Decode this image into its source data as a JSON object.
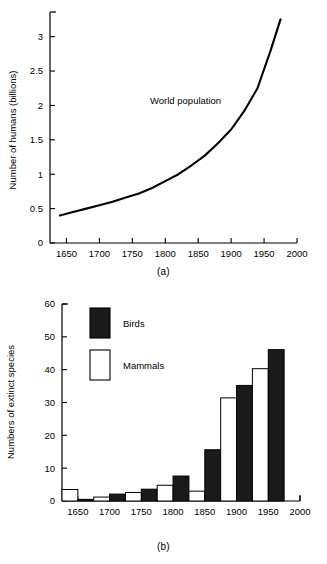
{
  "figure": {
    "panel_a_caption": "(a)",
    "panel_b_caption": "(b)"
  },
  "chart_data": [
    {
      "id": "world-population",
      "type": "line",
      "title": "",
      "annotation": "World population",
      "xlabel": "",
      "ylabel": "Number of humans (billions)",
      "xlim": [
        1625,
        2000
      ],
      "ylim": [
        0,
        3.3
      ],
      "grid": false,
      "legend_position": "none",
      "xticks": [
        1650,
        1700,
        1750,
        1800,
        1850,
        1900,
        1950,
        2000
      ],
      "xtick_labels": [
        "1650",
        "1700",
        "1750",
        "1800",
        "1850",
        "1900",
        "1950",
        "2000"
      ],
      "yticks": [
        0,
        0.5,
        1,
        1.5,
        2,
        2.5,
        3
      ],
      "ytick_labels": [
        "0",
        "0.5",
        "1",
        "1.5",
        "2",
        "2.5",
        "3"
      ],
      "x": [
        1640,
        1660,
        1680,
        1700,
        1720,
        1740,
        1760,
        1780,
        1800,
        1820,
        1840,
        1860,
        1880,
        1900,
        1920,
        1940,
        1960,
        1975
      ],
      "y": [
        0.4,
        0.45,
        0.5,
        0.55,
        0.6,
        0.66,
        0.72,
        0.8,
        0.9,
        1.0,
        1.13,
        1.27,
        1.45,
        1.65,
        1.92,
        2.25,
        2.8,
        3.25
      ],
      "series": [
        {
          "name": "World population",
          "values": [
            0.4,
            0.45,
            0.5,
            0.55,
            0.6,
            0.66,
            0.72,
            0.8,
            0.9,
            1.0,
            1.13,
            1.27,
            1.45,
            1.65,
            1.92,
            2.25,
            2.8,
            3.25
          ]
        }
      ]
    },
    {
      "id": "extinct-species",
      "type": "bar",
      "title": "",
      "xlabel": "",
      "ylabel": "Numbers of extinct species",
      "xlim": [
        1625,
        2000
      ],
      "ylim": [
        0,
        60
      ],
      "grid": false,
      "legend_position": "upper-left",
      "xticks": [
        1650,
        1700,
        1750,
        1800,
        1850,
        1900,
        1950,
        2000
      ],
      "xtick_labels": [
        "1650",
        "1700",
        "1750",
        "1800",
        "1850",
        "1900",
        "1950",
        "2000"
      ],
      "yticks": [
        0,
        10,
        20,
        30,
        40,
        50,
        60
      ],
      "ytick_labels": [
        "0",
        "10",
        "20",
        "30",
        "40",
        "50",
        "60"
      ],
      "categories": [
        "1625-1650",
        "1650-1675",
        "1675-1700",
        "1700-1725",
        "1725-1750",
        "1750-1775",
        "1775-1800",
        "1800-1825",
        "1825-1850",
        "1850-1875",
        "1875-1900",
        "1900-1925",
        "1925-1950",
        "1950-1975"
      ],
      "bars": [
        {
          "period_start": 1625,
          "period_end": 1650,
          "series": "Mammals",
          "value": 3.5
        },
        {
          "period_start": 1650,
          "period_end": 1675,
          "series": "Birds",
          "value": 0.5
        },
        {
          "period_start": 1675,
          "period_end": 1700,
          "series": "Mammals",
          "value": 1.2
        },
        {
          "period_start": 1700,
          "period_end": 1725,
          "series": "Birds",
          "value": 2.1
        },
        {
          "period_start": 1725,
          "period_end": 1750,
          "series": "Mammals",
          "value": 2.6
        },
        {
          "period_start": 1750,
          "period_end": 1775,
          "series": "Birds",
          "value": 3.6
        },
        {
          "period_start": 1775,
          "period_end": 1800,
          "series": "Mammals",
          "value": 4.8
        },
        {
          "period_start": 1800,
          "period_end": 1825,
          "series": "Birds",
          "value": 7.6
        },
        {
          "period_start": 1825,
          "period_end": 1850,
          "series": "Mammals",
          "value": 3.0
        },
        {
          "period_start": 1850,
          "period_end": 1875,
          "series": "Birds",
          "value": 15.6
        },
        {
          "period_start": 1875,
          "period_end": 1900,
          "series": "Mammals",
          "value": 31.4
        },
        {
          "period_start": 1900,
          "period_end": 1925,
          "series": "Birds",
          "value": 35.2
        },
        {
          "period_start": 1925,
          "period_end": 1950,
          "series": "Mammals",
          "value": 40.3
        },
        {
          "period_start": 1950,
          "period_end": 1975,
          "series": "Birds",
          "value": 46.1
        }
      ],
      "series": [
        {
          "name": "Birds",
          "color": "#1a1a1a",
          "values": [
            0.5,
            2.1,
            3.6,
            7.6,
            15.6,
            35.2,
            46.1
          ]
        },
        {
          "name": "Mammals",
          "color": "#ffffff",
          "values": [
            3.5,
            1.2,
            2.6,
            4.8,
            3.0,
            31.4,
            40.3
          ]
        }
      ],
      "legend": [
        {
          "label": "Birds",
          "swatch": "filled",
          "color": "#1a1a1a"
        },
        {
          "label": "Mammals",
          "swatch": "outline",
          "color": "#ffffff"
        }
      ]
    }
  ]
}
